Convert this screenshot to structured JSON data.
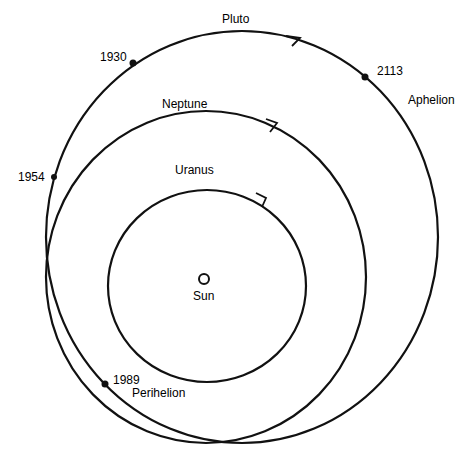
{
  "diagram": {
    "orbits": [
      {
        "name": "Pluto",
        "label": "Pluto"
      },
      {
        "name": "Neptune",
        "label": "Neptune"
      },
      {
        "name": "Uranus",
        "label": "Uranus"
      }
    ],
    "sun": {
      "label": "Sun"
    },
    "markers": [
      {
        "year": "1930"
      },
      {
        "year": "2113"
      },
      {
        "year": "1954"
      },
      {
        "year": "1989"
      }
    ],
    "annotations": {
      "aphelion": "Aphelion",
      "perihelion": "Perihelion"
    },
    "colors": {
      "line": "#111111",
      "background": "#ffffff"
    }
  }
}
